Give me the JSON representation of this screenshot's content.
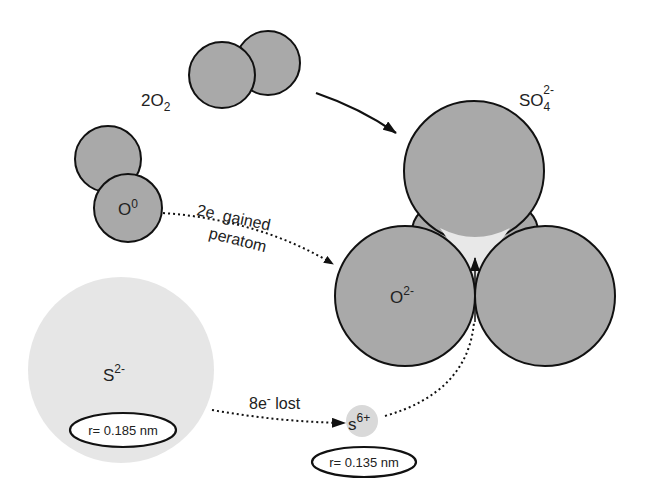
{
  "diagram": {
    "labels": {
      "o2": {
        "main": "2O",
        "sub": "2"
      },
      "sulfate": {
        "main": "SO",
        "sub": "4",
        "sup": "2-"
      },
      "o_atom": {
        "main": "O",
        "sup": "0"
      },
      "oxide": {
        "main": "O",
        "sup": "2-"
      },
      "sulfide": {
        "main": "S",
        "sup": "2-"
      },
      "sulfur_cation": {
        "main": "s",
        "sup": "6+"
      },
      "gain_line1": "2e  gained",
      "gain_line2": "peratom",
      "loss_main": "8e",
      "loss_sup": "-",
      "loss_rest": " lost",
      "sulfide_radius": "r= 0.185 nm",
      "cation_radius": "r= 0.135 nm"
    },
    "colors": {
      "oxygen_fill": "#a9a9a9",
      "sulfide_fill": "#e6e6e6",
      "cation_fill": "#d9d9d9",
      "gap_fill": "#e8e8e8",
      "stroke": "#111111"
    }
  }
}
